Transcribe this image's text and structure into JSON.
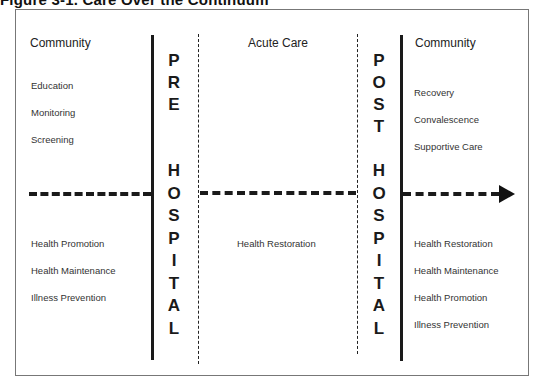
{
  "title": "Figure 3-1.  Care Over the Continuum",
  "columns": {
    "left": {
      "heading": "Community",
      "upper_items": [
        "Education",
        "Monitoring",
        "Screening"
      ],
      "lower_items": [
        "Health Promotion",
        "Health Maintenance",
        "Illness Prevention"
      ]
    },
    "pre_hospital": {
      "upper_letters": [
        "P",
        "R",
        "E"
      ],
      "lower_letters": [
        "H",
        "O",
        "S",
        "P",
        "I",
        "T",
        "A",
        "L"
      ]
    },
    "middle": {
      "heading": "Acute Care",
      "lower_items": [
        "Health Restoration"
      ]
    },
    "post_hospital": {
      "upper_letters": [
        "P",
        "O",
        "S",
        "T"
      ],
      "lower_letters": [
        "H",
        "O",
        "S",
        "P",
        "I",
        "T",
        "A",
        "L"
      ]
    },
    "right": {
      "heading": "Community",
      "upper_items": [
        "Recovery",
        "Convalescence",
        "Supportive Care"
      ],
      "lower_items": [
        "Health Restoration",
        "Health Maintenance",
        "Health Promotion",
        "Illness Prevention"
      ]
    }
  },
  "timeline": {
    "direction": "left-to-right",
    "arrow": "arrow-right-icon"
  }
}
